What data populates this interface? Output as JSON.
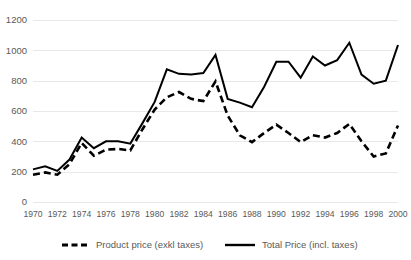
{
  "chart_data": {
    "type": "line",
    "title": "",
    "xlabel": "",
    "ylabel": "",
    "ylim": [
      0,
      1200
    ],
    "xlim": [
      1970,
      2000
    ],
    "grid": true,
    "legend_position": "bottom",
    "y_ticks": [
      0,
      200,
      400,
      600,
      800,
      1000,
      1200
    ],
    "y_tick_labels": [
      "0",
      "200",
      "400",
      "600",
      "800",
      "1000",
      "1200"
    ],
    "x_ticks": [
      1970,
      1972,
      1974,
      1976,
      1978,
      1980,
      1982,
      1984,
      1986,
      1988,
      1990,
      1992,
      1994,
      1996,
      1998,
      2000
    ],
    "x_tick_labels": [
      "1970",
      "1972",
      "1974",
      "1976",
      "1978",
      "1980",
      "1982",
      "1984",
      "1986",
      "1988",
      "1990",
      "1992",
      "1994",
      "1996",
      "1998",
      "2000"
    ],
    "x": [
      1970,
      1971,
      1972,
      1973,
      1974,
      1975,
      1976,
      1977,
      1978,
      1979,
      1980,
      1981,
      1982,
      1983,
      1984,
      1985,
      1986,
      1987,
      1988,
      1989,
      1990,
      1991,
      1992,
      1993,
      1994,
      1995,
      1996,
      1997,
      1998,
      1999,
      2000
    ],
    "series": [
      {
        "name": "Product price (exkl taxes)",
        "style": "dashed",
        "color": "#000000",
        "values": [
          180,
          195,
          180,
          250,
          390,
          305,
          345,
          350,
          340,
          480,
          610,
          690,
          725,
          680,
          665,
          795,
          570,
          440,
          395,
          455,
          510,
          455,
          395,
          440,
          425,
          455,
          515,
          400,
          300,
          320,
          505
        ]
      },
      {
        "name": "Total Price (incl. taxes)",
        "style": "solid",
        "color": "#000000",
        "values": [
          215,
          235,
          205,
          280,
          425,
          355,
          400,
          400,
          385,
          520,
          660,
          875,
          845,
          840,
          850,
          970,
          680,
          655,
          625,
          760,
          925,
          925,
          820,
          960,
          900,
          935,
          1050,
          840,
          780,
          800,
          1035
        ]
      }
    ]
  },
  "legend": {
    "items": [
      {
        "label": "Product price (exkl taxes)",
        "style": "dashed"
      },
      {
        "label": "Total Price (incl. taxes)",
        "style": "solid"
      }
    ]
  }
}
